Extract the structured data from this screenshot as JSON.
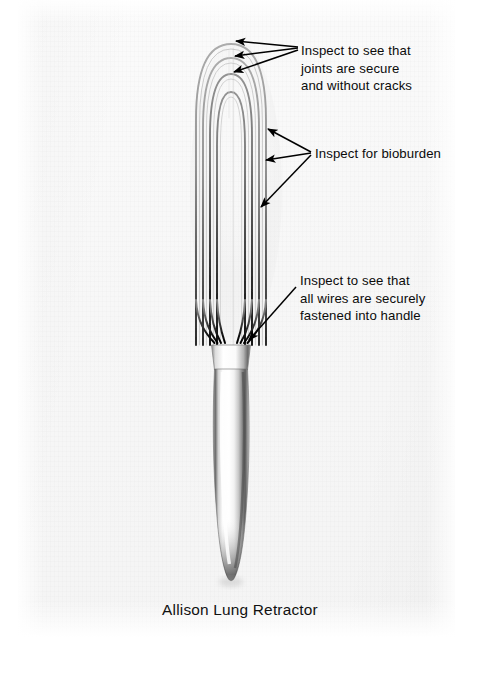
{
  "figure": {
    "caption": "Allison Lung Retractor",
    "background_color": "#f7f7f7",
    "page_color": "#ffffff",
    "ink_color": "#0b0b0b"
  },
  "annotations": [
    {
      "id": "joints",
      "lines": [
        "Inspect to see that",
        "joints are secure",
        "and without cracks"
      ],
      "text": "Inspect to see that\njoints are secure\nand without cracks",
      "arrow_count": 3,
      "points_to": "tops of the nested wire loops"
    },
    {
      "id": "bioburden",
      "lines": [
        "Inspect for bioburden"
      ],
      "text": "Inspect for bioburden",
      "arrow_count": 3,
      "points_to": "right-hand side wires of the loop basket"
    },
    {
      "id": "handle",
      "lines": [
        "Inspect to see that",
        "all wires are securely",
        "fastened into handle"
      ],
      "text": "Inspect to see that\nall wires are securely\nfastened into handle",
      "arrow_count": 1,
      "points_to": "ferrule where the wires enter the handle"
    }
  ]
}
